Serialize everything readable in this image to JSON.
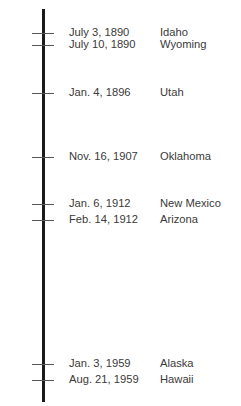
{
  "events": [
    {
      "date": "July 3, 1890",
      "state": "Idaho",
      "year": 1890.5
    },
    {
      "date": "July 10, 1890",
      "state": "Wyoming",
      "year": 1890.52
    },
    {
      "date": "Jan. 4, 1896",
      "state": "Utah",
      "year": 1896.01
    },
    {
      "date": "Nov. 16, 1907",
      "state": "Oklahoma",
      "year": 1907.87
    },
    {
      "date": "Jan. 6, 1912",
      "state": "New Mexico",
      "year": 1912.02
    },
    {
      "date": "Feb. 14, 1912",
      "state": "Arizona",
      "year": 1912.12
    },
    {
      "date": "Jan. 3, 1959",
      "state": "Alaska",
      "year": 1959.01
    },
    {
      "date": "Aug. 21, 1959",
      "state": "Hawaii",
      "year": 1959.64
    }
  ]
}
